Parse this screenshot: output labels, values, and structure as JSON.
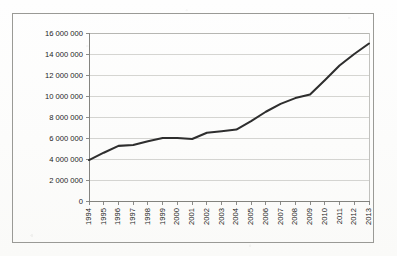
{
  "figure": {
    "background_color": "#fdfdfc",
    "frame_color": "#9a9a96",
    "line_color": "#2e2e2e",
    "grid_color": "#c3c3bf",
    "axis_color": "#7d7d79"
  },
  "chart_data": {
    "type": "line",
    "title": "",
    "subtitle": "",
    "xlabel": "",
    "ylabel": "",
    "legend": [],
    "legend_position": "none",
    "grid": "horizontal",
    "xlim": [
      1994,
      2013
    ],
    "ylim": [
      0,
      16000000
    ],
    "ytick_step": 2000000,
    "ytick_labels": [
      "16 000 000",
      "14 000 000",
      "12 000 000",
      "10 000 000",
      "8 000 000",
      "6 000 000",
      "4 000 000",
      "2 000 000",
      "0"
    ],
    "ytick_values": [
      16000000,
      14000000,
      12000000,
      10000000,
      8000000,
      6000000,
      4000000,
      2000000,
      0
    ],
    "xtick_labels": [
      "1994",
      "1995",
      "1996",
      "1997",
      "1998",
      "1999",
      "2000",
      "2001",
      "2002",
      "2003",
      "2004",
      "2005",
      "2006",
      "2007",
      "2008",
      "2009",
      "2010",
      "2011",
      "2012",
      "2013"
    ],
    "xtick_rotation": -90,
    "categories": [
      1994,
      1995,
      1996,
      1997,
      1998,
      1999,
      2000,
      2001,
      2002,
      2003,
      2004,
      2005,
      2006,
      2007,
      2008,
      2009,
      2010,
      2011,
      2012,
      2013
    ],
    "values": [
      3900000,
      4600000,
      5250000,
      5330000,
      5700000,
      6000000,
      6000000,
      5900000,
      6500000,
      6650000,
      6800000,
      7600000,
      8500000,
      9250000,
      9800000,
      10150000,
      11500000,
      12900000,
      14000000,
      15000000
    ],
    "series": [
      {
        "name": "",
        "values": [
          3900000,
          4600000,
          5250000,
          5330000,
          5700000,
          6000000,
          6000000,
          5900000,
          6500000,
          6650000,
          6800000,
          7600000,
          8500000,
          9250000,
          9800000,
          10150000,
          11500000,
          12900000,
          14000000,
          15000000
        ],
        "color": "#2e2e2e"
      }
    ]
  }
}
